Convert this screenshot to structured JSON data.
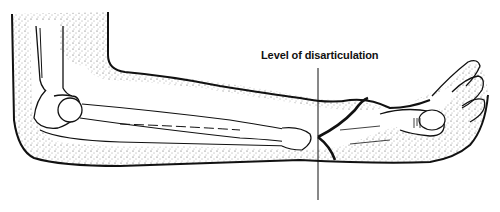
{
  "figure": {
    "annotation": {
      "label": "Level of disarticulation",
      "line_x": 318,
      "line_y_range": [
        68,
        200
      ]
    },
    "colors": {
      "ink": "#111111",
      "background": "#ffffff"
    }
  }
}
